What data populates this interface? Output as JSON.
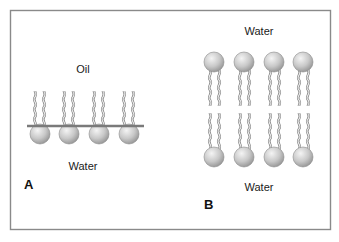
{
  "figure": {
    "frame_color": "#8a8a8a",
    "head_fill_light": "#f2f2f2",
    "head_fill_dark": "#9a9a9a",
    "tail_color": "#8c8c8c",
    "interface_line_color": "#7a7a7a"
  },
  "panel_a": {
    "letter": "A",
    "top_label": "Oil",
    "bottom_label": "Water",
    "description": "Phospholipid monolayer at oil-water interface",
    "molecule_count": 4
  },
  "panel_b": {
    "letter": "B",
    "top_label": "Water",
    "bottom_label": "Water",
    "description": "Phospholipid bilayer between two aqueous compartments",
    "molecule_count_per_leaflet": 4
  }
}
